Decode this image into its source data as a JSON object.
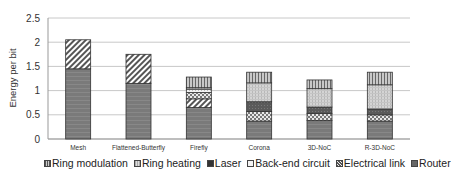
{
  "chart_data": {
    "type": "bar",
    "stacked": true,
    "title": "",
    "xlabel": "",
    "ylabel": "Energy per bit",
    "ylim": [
      0,
      2.5
    ],
    "yticks": [
      "0",
      "0.5",
      "1",
      "1.5",
      "2",
      "2.5"
    ],
    "grid": true,
    "legend_position": "bottom",
    "categories": [
      "Mesh",
      "Flattened-Butterfly",
      "Firefly",
      "Corona",
      "3D-NoC",
      "R-3D-NoC"
    ],
    "series": [
      {
        "name": "Router",
        "values": [
          1.45,
          1.15,
          0.65,
          0.37,
          0.38,
          0.37
        ]
      },
      {
        "name": "Electrical link",
        "values": [
          0.6,
          0.6,
          0.18,
          0.2,
          0.15,
          0.13
        ]
      },
      {
        "name": "Back-end circuit",
        "values": [
          0,
          0,
          0.13,
          0,
          0,
          0
        ]
      },
      {
        "name": "Laser",
        "values": [
          0,
          0,
          0.07,
          0.2,
          0.13,
          0.12
        ]
      },
      {
        "name": "Ring heating",
        "values": [
          0,
          0,
          0.03,
          0.39,
          0.38,
          0.5
        ]
      },
      {
        "name": "Ring modulation",
        "values": [
          0,
          0,
          0.22,
          0.22,
          0.18,
          0.26
        ]
      }
    ],
    "totals": [
      2.05,
      1.75,
      1.28,
      1.38,
      1.22,
      1.38
    ]
  },
  "legend": [
    {
      "label": "Ring modulation",
      "pattern": "vstripes"
    },
    {
      "label": "Ring heating",
      "pattern": "grid"
    },
    {
      "label": "Laser",
      "pattern": "dark"
    },
    {
      "label": "Back-end circuit",
      "pattern": "light"
    },
    {
      "label": "Electrical link",
      "pattern": "checker"
    },
    {
      "label": "Router",
      "pattern": "router"
    }
  ]
}
